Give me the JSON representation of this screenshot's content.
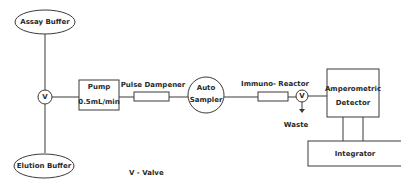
{
  "diagram": {
    "colors": {
      "stroke": "#3a3a3a",
      "text": "#2a2a2a",
      "background": "#ffffff"
    },
    "nodes": {
      "assay_buffer": {
        "label": "Assay Buffer",
        "shape": "ellipse"
      },
      "elution_buffer": {
        "label": "Elution Buffer",
        "shape": "ellipse"
      },
      "valve_inlet": {
        "label": "V",
        "shape": "circle"
      },
      "pump": {
        "label": "Pump",
        "rate": "0.5mL/min",
        "shape": "rect"
      },
      "pulse_dampener": {
        "label": "Pulse Dampener",
        "shape": "small-rect"
      },
      "auto_sampler": {
        "line1": "Auto",
        "line2": "Sampler",
        "shape": "circle"
      },
      "immuno_reactor": {
        "label": "Immuno- Reactor",
        "shape": "small-rect"
      },
      "valve_outlet": {
        "label": "V",
        "shape": "circle"
      },
      "waste": {
        "label": "Waste"
      },
      "detector": {
        "line1": "Amperometric",
        "line2": "Detector",
        "shape": "rect"
      },
      "integrator": {
        "label": "Integrator",
        "shape": "rect"
      }
    },
    "legend": {
      "text": "V - Valve"
    }
  }
}
